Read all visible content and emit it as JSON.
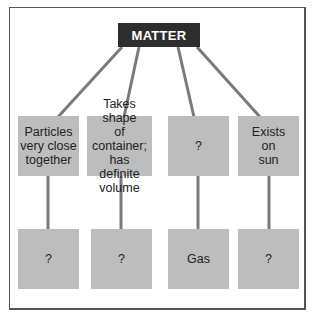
{
  "diagram": {
    "root": {
      "label": "MATTER"
    },
    "top_row": [
      {
        "label": "Particles very close together",
        "lines": [
          "Particles",
          "very close",
          "together"
        ]
      },
      {
        "label": "Takes shape of container; has definite volume",
        "lines": [
          "Takes shape",
          "of container;",
          "has definite",
          "volume"
        ]
      },
      {
        "label": "?",
        "lines": [
          "?"
        ]
      },
      {
        "label": "Exists on sun",
        "lines": [
          "Exists",
          "on",
          "sun"
        ]
      }
    ],
    "bottom_row": [
      {
        "label": "?"
      },
      {
        "label": "?"
      },
      {
        "label": "Gas"
      },
      {
        "label": "?"
      }
    ],
    "colors": {
      "root_fill": "#2d2d2d",
      "root_text": "#ffffff",
      "box_fill": "#bdbdbd",
      "connector": "#7a7a7a",
      "frame": "#555555"
    }
  }
}
